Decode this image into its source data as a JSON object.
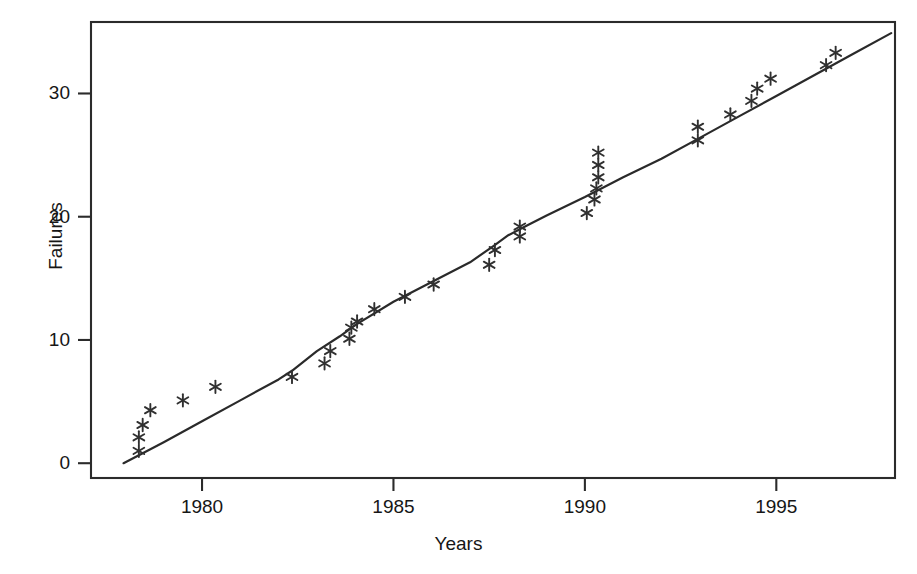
{
  "chart_data": {
    "type": "scatter",
    "title": "",
    "xlabel": "Years",
    "ylabel": "Failures",
    "xlim": [
      1977.1,
      1998.1
    ],
    "ylim": [
      -1.2,
      35.8
    ],
    "grid": false,
    "legend": null,
    "marker": "asterisk",
    "x_ticks": [
      1980,
      1985,
      1990,
      1995
    ],
    "x_tick_labels": [
      "1980",
      "1985",
      "1990",
      "1995"
    ],
    "y_ticks": [
      0,
      10,
      20,
      30
    ],
    "y_tick_labels": [
      "0",
      "10",
      "20",
      "30"
    ],
    "series": [
      {
        "name": "Observed failures",
        "type": "scatter",
        "marker": "asterisk",
        "color": "#303030",
        "points": [
          {
            "x": 1978.35,
            "y": 1.0
          },
          {
            "x": 1978.35,
            "y": 2.1
          },
          {
            "x": 1978.45,
            "y": 3.1
          },
          {
            "x": 1978.65,
            "y": 4.3
          },
          {
            "x": 1979.5,
            "y": 5.1
          },
          {
            "x": 1980.35,
            "y": 6.2
          },
          {
            "x": 1982.35,
            "y": 7.0
          },
          {
            "x": 1983.2,
            "y": 8.1
          },
          {
            "x": 1983.35,
            "y": 9.1
          },
          {
            "x": 1983.85,
            "y": 10.1
          },
          {
            "x": 1983.9,
            "y": 11.0
          },
          {
            "x": 1984.05,
            "y": 11.5
          },
          {
            "x": 1984.5,
            "y": 12.5
          },
          {
            "x": 1985.3,
            "y": 13.5
          },
          {
            "x": 1986.05,
            "y": 14.5
          },
          {
            "x": 1987.5,
            "y": 16.1
          },
          {
            "x": 1987.65,
            "y": 17.3
          },
          {
            "x": 1988.3,
            "y": 18.4
          },
          {
            "x": 1988.3,
            "y": 19.2
          },
          {
            "x": 1990.05,
            "y": 20.3
          },
          {
            "x": 1990.25,
            "y": 21.4
          },
          {
            "x": 1990.3,
            "y": 22.3
          },
          {
            "x": 1990.35,
            "y": 23.2
          },
          {
            "x": 1990.35,
            "y": 24.2
          },
          {
            "x": 1990.35,
            "y": 25.2
          },
          {
            "x": 1992.95,
            "y": 26.2
          },
          {
            "x": 1992.95,
            "y": 27.3
          },
          {
            "x": 1993.8,
            "y": 28.3
          },
          {
            "x": 1994.35,
            "y": 29.4
          },
          {
            "x": 1994.5,
            "y": 30.4
          },
          {
            "x": 1994.85,
            "y": 31.2
          },
          {
            "x": 1996.3,
            "y": 32.3
          },
          {
            "x": 1996.55,
            "y": 33.3
          }
        ]
      },
      {
        "name": "Fitted trend",
        "type": "line",
        "color": "#2a2a2a",
        "points": [
          {
            "x": 1977.95,
            "y": 0.0
          },
          {
            "x": 1979.0,
            "y": 1.7
          },
          {
            "x": 1980.0,
            "y": 3.4
          },
          {
            "x": 1981.0,
            "y": 5.1
          },
          {
            "x": 1982.0,
            "y": 6.8
          },
          {
            "x": 1982.35,
            "y": 7.5
          },
          {
            "x": 1983.0,
            "y": 9.1
          },
          {
            "x": 1983.6,
            "y": 10.3
          },
          {
            "x": 1984.0,
            "y": 11.2
          },
          {
            "x": 1985.0,
            "y": 13.1
          },
          {
            "x": 1986.0,
            "y": 14.7
          },
          {
            "x": 1987.0,
            "y": 16.3
          },
          {
            "x": 1987.6,
            "y": 17.6
          },
          {
            "x": 1988.0,
            "y": 18.5
          },
          {
            "x": 1988.5,
            "y": 19.3
          },
          {
            "x": 1989.0,
            "y": 20.1
          },
          {
            "x": 1990.0,
            "y": 21.6
          },
          {
            "x": 1991.0,
            "y": 23.2
          },
          {
            "x": 1992.0,
            "y": 24.7
          },
          {
            "x": 1993.0,
            "y": 26.4
          },
          {
            "x": 1994.0,
            "y": 28.1
          },
          {
            "x": 1995.0,
            "y": 29.8
          },
          {
            "x": 1996.0,
            "y": 31.5
          },
          {
            "x": 1997.0,
            "y": 33.2
          },
          {
            "x": 1998.0,
            "y": 34.9
          }
        ]
      }
    ]
  },
  "axes": {
    "x_axis_label": "Years",
    "y_axis_label": "Failures"
  }
}
